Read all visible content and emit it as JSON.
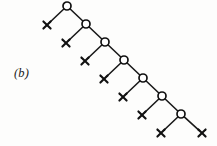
{
  "figure": {
    "panel_label": "(b)",
    "panel_label_x": 14,
    "panel_label_y": 66,
    "width": 217,
    "height": 146,
    "background_color": "#fdfdfc",
    "ink_color": "#111111"
  },
  "chart_data": {
    "type": "diagram",
    "title": "(b)",
    "node_radius": 4,
    "leaf_arm": 3.6,
    "internal_nodes": [
      {
        "id": "n1",
        "x": 67,
        "y": 6
      },
      {
        "id": "n2",
        "x": 86,
        "y": 24
      },
      {
        "id": "n3",
        "x": 105,
        "y": 42
      },
      {
        "id": "n4",
        "x": 124,
        "y": 60
      },
      {
        "id": "n5",
        "x": 143,
        "y": 78
      },
      {
        "id": "n6",
        "x": 162,
        "y": 96
      },
      {
        "id": "n7",
        "x": 181,
        "y": 114
      }
    ],
    "leaf_nodes": [
      {
        "id": "l1",
        "x": 47,
        "y": 25
      },
      {
        "id": "l2",
        "x": 66,
        "y": 43
      },
      {
        "id": "l3",
        "x": 85,
        "y": 61
      },
      {
        "id": "l4",
        "x": 104,
        "y": 79
      },
      {
        "id": "l5",
        "x": 123,
        "y": 97
      },
      {
        "id": "l6",
        "x": 142,
        "y": 115
      },
      {
        "id": "l7",
        "x": 161,
        "y": 133
      },
      {
        "id": "l8",
        "x": 202,
        "y": 133
      }
    ],
    "edges": [
      {
        "from": "n1",
        "to": "l1"
      },
      {
        "from": "n1",
        "to": "n2"
      },
      {
        "from": "n2",
        "to": "l2"
      },
      {
        "from": "n2",
        "to": "n3"
      },
      {
        "from": "n3",
        "to": "l3"
      },
      {
        "from": "n3",
        "to": "n4"
      },
      {
        "from": "n4",
        "to": "l4"
      },
      {
        "from": "n4",
        "to": "n5"
      },
      {
        "from": "n5",
        "to": "l5"
      },
      {
        "from": "n5",
        "to": "n6"
      },
      {
        "from": "n6",
        "to": "l6"
      },
      {
        "from": "n6",
        "to": "n7"
      },
      {
        "from": "n7",
        "to": "l7"
      },
      {
        "from": "n7",
        "to": "l8"
      }
    ]
  }
}
